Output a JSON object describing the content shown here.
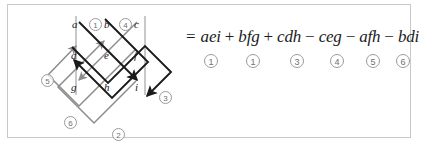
{
  "figure": {
    "caption_title": "Rule of Sarrus determinant expansion",
    "panel_border_color": "#c9c9c9",
    "background_color": "#ffffff"
  },
  "diagram": {
    "name": "sarrus-arrow-diagram",
    "matrix_letters": [
      {
        "id": "a",
        "label": "a",
        "x": 64,
        "y": 14
      },
      {
        "id": "b",
        "label": "b",
        "x": 96,
        "y": 14
      },
      {
        "id": "c",
        "label": "c",
        "x": 126,
        "y": 14
      },
      {
        "id": "d",
        "label": "d",
        "x": 63,
        "y": 45
      },
      {
        "id": "e",
        "label": "e",
        "x": 96,
        "y": 45
      },
      {
        "id": "f",
        "label": "f",
        "x": 126,
        "y": 45
      },
      {
        "id": "g",
        "label": "g",
        "x": 63,
        "y": 77
      },
      {
        "id": "h",
        "label": "h",
        "x": 96,
        "y": 77
      },
      {
        "id": "i",
        "label": "i",
        "x": 127,
        "y": 77
      }
    ],
    "markers": [
      {
        "id": "m1",
        "label": "1",
        "x": 81,
        "y": 13
      },
      {
        "id": "m4",
        "label": "4",
        "x": 111,
        "y": 13
      },
      {
        "id": "m5",
        "label": "5",
        "x": 33,
        "y": 69
      },
      {
        "id": "m3",
        "label": "3",
        "x": 151,
        "y": 86
      },
      {
        "id": "m6",
        "label": "6",
        "x": 56,
        "y": 111
      },
      {
        "id": "m2",
        "label": "2",
        "x": 104,
        "y": 123
      }
    ],
    "colors": {
      "positive_arrow": "#1a1a1a",
      "negative_arrow": "#8c8c8c",
      "guide_line": "#9b9b9b"
    }
  },
  "equation": {
    "equals_sign": "=",
    "terms": [
      {
        "op": "",
        "term": "aei",
        "index": "1"
      },
      {
        "op": "+",
        "term": "bfg",
        "index": "1"
      },
      {
        "op": "+",
        "term": "cdh",
        "index": "3"
      },
      {
        "op": "−",
        "term": "ceg",
        "index": "4"
      },
      {
        "op": "−",
        "term": "afh",
        "index": "5"
      },
      {
        "op": "−",
        "term": "bdi",
        "index": "6"
      }
    ],
    "index_positions": [
      18,
      60,
      104,
      144,
      180,
      210
    ]
  }
}
